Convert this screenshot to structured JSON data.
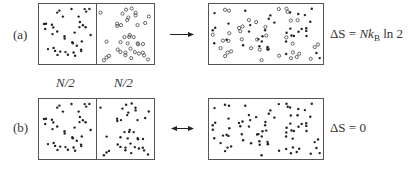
{
  "panels": [
    {
      "id": "a",
      "label": "(a)",
      "arrow": "right",
      "equation": {
        "lhs": "ΔS",
        "eq": "=",
        "N": "N",
        "k": "k",
        "sub": "B",
        "rest": "ln 2"
      },
      "left_half_particles": "filled",
      "right_half_particles": "open",
      "mixed": true
    },
    {
      "id": "b",
      "label": "(b)",
      "arrow": "both",
      "equation": {
        "lhs": "ΔS",
        "eq": "=",
        "value": "0"
      },
      "left_half_particles": "filled",
      "right_half_particles": "filled",
      "mixed": false
    }
  ],
  "half_labels": [
    "N/2",
    "N/2"
  ],
  "colors": {
    "border": "#555555",
    "dot": "#222222",
    "open_stroke": "#444444"
  }
}
